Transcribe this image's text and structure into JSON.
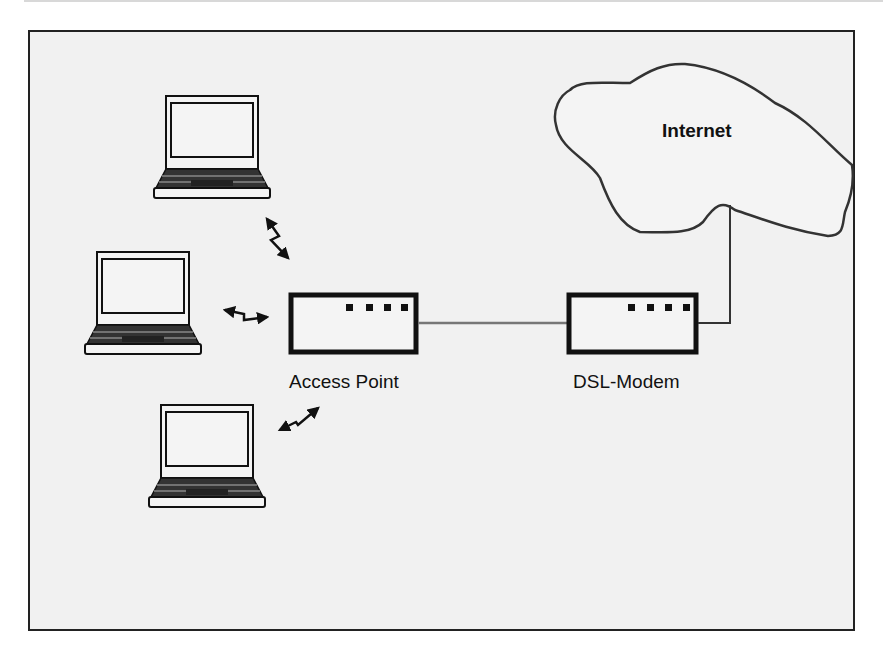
{
  "diagram": {
    "type": "network-topology",
    "nodes": [
      {
        "id": "laptop-1",
        "kind": "laptop-icon"
      },
      {
        "id": "laptop-2",
        "kind": "laptop-icon"
      },
      {
        "id": "laptop-3",
        "kind": "laptop-icon"
      },
      {
        "id": "access-point",
        "kind": "network-device",
        "label": "Access Point"
      },
      {
        "id": "dsl-modem",
        "kind": "network-device",
        "label": "DSL-Modem"
      },
      {
        "id": "internet",
        "kind": "cloud",
        "label": "Internet"
      }
    ],
    "edges": [
      {
        "from": "laptop-1",
        "to": "access-point",
        "style": "wireless-zigzag"
      },
      {
        "from": "laptop-2",
        "to": "access-point",
        "style": "wireless-zigzag"
      },
      {
        "from": "laptop-3",
        "to": "access-point",
        "style": "wireless-zigzag"
      },
      {
        "from": "access-point",
        "to": "dsl-modem",
        "style": "wire"
      },
      {
        "from": "dsl-modem",
        "to": "internet",
        "style": "wire"
      }
    ]
  },
  "labels": {
    "access_point": "Access Point",
    "dsl_modem": "DSL-Modem",
    "internet": "Internet"
  },
  "colors": {
    "background": "#f1f1f1",
    "stroke": "#111111",
    "wire": "#777777"
  }
}
